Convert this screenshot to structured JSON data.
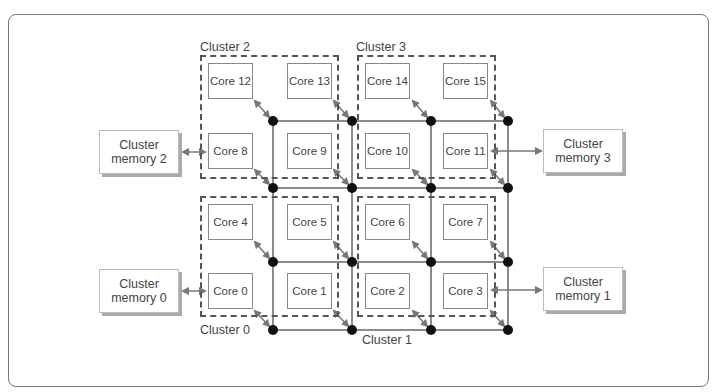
{
  "diagram": {
    "type": "mesh-network-of-core-clusters",
    "clusters": [
      {
        "label": "Cluster 0",
        "cores": [
          "Core 0",
          "Core 1",
          "Core 4",
          "Core 5"
        ]
      },
      {
        "label": "Cluster 1",
        "cores": [
          "Core 2",
          "Core 3",
          "Core 6",
          "Core 7"
        ]
      },
      {
        "label": "Cluster 2",
        "cores": [
          "Core 8",
          "Core 9",
          "Core 12",
          "Core 13"
        ]
      },
      {
        "label": "Cluster 3",
        "cores": [
          "Core 10",
          "Core 11",
          "Core 14",
          "Core 15"
        ]
      }
    ],
    "cores": {
      "c0": "Core 0",
      "c1": "Core 1",
      "c2": "Core 2",
      "c3": "Core 3",
      "c4": "Core 4",
      "c5": "Core 5",
      "c6": "Core 6",
      "c7": "Core 7",
      "c8": "Core 8",
      "c9": "Core 9",
      "c10": "Core 10",
      "c11": "Core 11",
      "c12": "Core 12",
      "c13": "Core 13",
      "c14": "Core 14",
      "c15": "Core 15"
    },
    "cluster_labels": {
      "cl0": "Cluster 0",
      "cl1": "Cluster 1",
      "cl2": "Cluster 2",
      "cl3": "Cluster 3"
    },
    "memories": {
      "m0": {
        "line1": "Cluster",
        "line2": "memory 0",
        "connects_to": "Core 0"
      },
      "m1": {
        "line1": "Cluster",
        "line2": "memory 1",
        "connects_to": "Core 3"
      },
      "m2": {
        "line1": "Cluster",
        "line2": "memory 2",
        "connects_to": "Core 8"
      },
      "m3": {
        "line1": "Cluster",
        "line2": "memory 3",
        "connects_to": "Core 11"
      }
    },
    "mesh": {
      "rows": 4,
      "cols": 4,
      "node_color": "#111111",
      "link_color": "#666666"
    }
  }
}
